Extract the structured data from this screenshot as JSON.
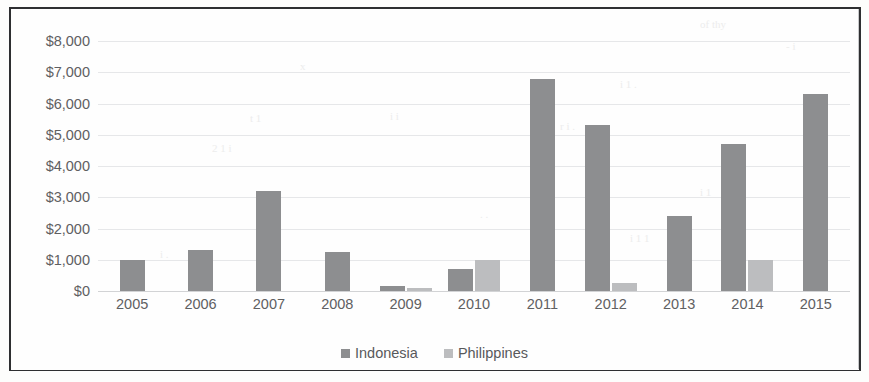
{
  "chart_data": {
    "type": "bar",
    "title": "",
    "subtitle": "",
    "xlabel": "",
    "ylabel": "",
    "categories": [
      "2005",
      "2006",
      "2007",
      "2008",
      "2009",
      "2010",
      "2011",
      "2012",
      "2013",
      "2014",
      "2015"
    ],
    "series": [
      {
        "name": "Indonesia",
        "color": "#8d8e90",
        "values": [
          1000,
          1300,
          3200,
          1250,
          150,
          700,
          6800,
          5300,
          2400,
          4700,
          6300
        ]
      },
      {
        "name": "Philippines",
        "color": "#bcbdbf",
        "values": [
          0,
          0,
          0,
          0,
          100,
          1000,
          0,
          250,
          0,
          1000,
          0
        ]
      }
    ],
    "ylim": [
      0,
      8000
    ],
    "ytick_values": [
      0,
      1000,
      2000,
      3000,
      4000,
      5000,
      6000,
      7000,
      8000
    ],
    "ytick_labels": [
      "$0",
      "$1,000",
      "$2,000",
      "$3,000",
      "$4,000",
      "$5,000",
      "$6,000",
      "$7,000",
      "$8,000"
    ],
    "grid": true,
    "legend_position": "bottom",
    "legend_entries": [
      "Indonesia",
      "Philippines"
    ]
  },
  "scan_artifacts": [
    {
      "text": "of thy",
      "left": 700,
      "top": 18
    },
    {
      "text": "- i",
      "left": 786,
      "top": 40
    },
    {
      "text": "x",
      "left": 300,
      "top": 60
    },
    {
      "text": "i 1 .",
      "left": 620,
      "top": 78
    },
    {
      "text": "t 1",
      "left": 250,
      "top": 112
    },
    {
      "text": "i i",
      "left": 390,
      "top": 110
    },
    {
      "text": "r i .",
      "left": 560,
      "top": 120
    },
    {
      "text": "2 1 i",
      "left": 212,
      "top": 142
    },
    {
      "text": "i",
      "left": 600,
      "top": 148
    },
    {
      "text": "i 1",
      "left": 700,
      "top": 186
    },
    {
      "text": ". .",
      "left": 480,
      "top": 208
    },
    {
      "text": "i 1 1",
      "left": 630,
      "top": 232
    },
    {
      "text": "i .",
      "left": 160,
      "top": 248
    }
  ]
}
